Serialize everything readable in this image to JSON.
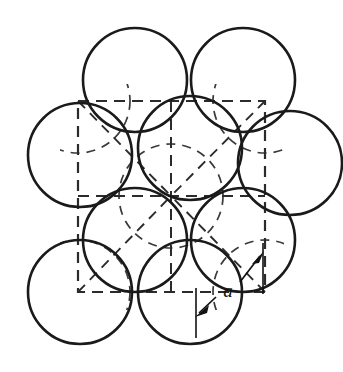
{
  "figure": {
    "label_a": "a",
    "label_a_meaning": "lattice parameter",
    "colors": {
      "atom_outline": "#1a1a1a",
      "hidden_arc": "#3a3a3a",
      "cell_edge": "#2b2b2b",
      "dimension": "#111111",
      "background": "#ffffff"
    },
    "geometry": {
      "canvas": {
        "width": 343,
        "height": 372
      },
      "atom_radius": 52,
      "atom_centers": [
        {
          "name": "corner-top-left",
          "cx": 80,
          "cy": 80
        },
        {
          "name": "face-top-center",
          "cx": 171,
          "cy": 80
        },
        {
          "name": "corner-top-right",
          "cx": 265,
          "cy": 80
        },
        {
          "name": "face-middle-left",
          "cx": 80,
          "cy": 163
        },
        {
          "name": "center-atom",
          "cx": 171,
          "cy": 163
        },
        {
          "name": "face-middle-right",
          "cx": 265,
          "cy": 163
        },
        {
          "name": "corner-bottom-left",
          "cx": 80,
          "cy": 292
        },
        {
          "name": "face-bottom-center",
          "cx": 171,
          "cy": 292
        },
        {
          "name": "corner-bottom-right",
          "cx": 265,
          "cy": 292
        }
      ],
      "unit_cell_square": {
        "x1": 78,
        "y1": 101,
        "x2": 265,
        "y2": 292
      },
      "lattice_points": [
        {
          "x": 78,
          "y": 101
        },
        {
          "x": 171,
          "y": 101
        },
        {
          "x": 265,
          "y": 101
        },
        {
          "x": 78,
          "y": 196
        },
        {
          "x": 171,
          "y": 196
        },
        {
          "x": 265,
          "y": 196
        },
        {
          "x": 78,
          "y": 292
        },
        {
          "x": 171,
          "y": 292
        },
        {
          "x": 265,
          "y": 292
        }
      ],
      "hidden_arc_radius": 52,
      "dimension_arrow": {
        "from": {
          "x": 196,
          "y": 316
        },
        "to": {
          "x": 263,
          "y": 252
        },
        "label_position": {
          "x": 228,
          "y": 295
        },
        "double_headed": true
      },
      "extension_lines": [
        {
          "x1": 196,
          "y1": 286,
          "x2": 196,
          "y2": 336
        },
        {
          "x1": 263,
          "y1": 240,
          "x2": 263,
          "y2": 292
        }
      ]
    }
  }
}
